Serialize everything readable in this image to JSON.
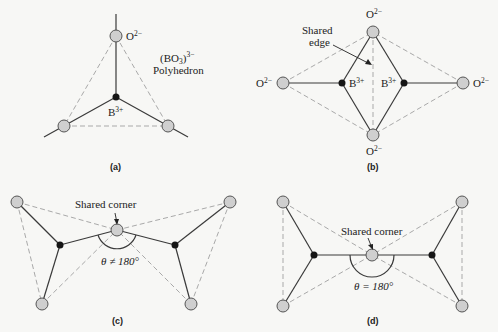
{
  "panels": {
    "a": {
      "caption": "(a)",
      "oxygen_label": "O",
      "oxygen_charge": "2−",
      "boron_label": "B",
      "boron_charge": "3+",
      "polyhedron_formula_base": "(BO",
      "polyhedron_formula_sub": "3",
      "polyhedron_formula_close": ")",
      "polyhedron_formula_charge": "3−",
      "polyhedron_label": "Polyhedron"
    },
    "b": {
      "caption": "(b)",
      "oxygen_label": "O",
      "oxygen_charge": "2−",
      "boron_label": "B",
      "boron_charge": "3+",
      "shared_edge_line1": "Shared",
      "shared_edge_line2": "edge"
    },
    "c": {
      "caption": "(c)",
      "shared_label": "Shared corner",
      "angle_label": "θ ≠ 180°"
    },
    "d": {
      "caption": "(d)",
      "shared_label": "Shared corner",
      "angle_label": "θ = 180°"
    }
  },
  "colors": {
    "background": "#f7f7f5",
    "oxygen_fill": "#cfcfcf",
    "boron_fill": "#151515",
    "bond_line": "#3a3a3a",
    "polyhedron_edge": "#a9a9a9"
  }
}
